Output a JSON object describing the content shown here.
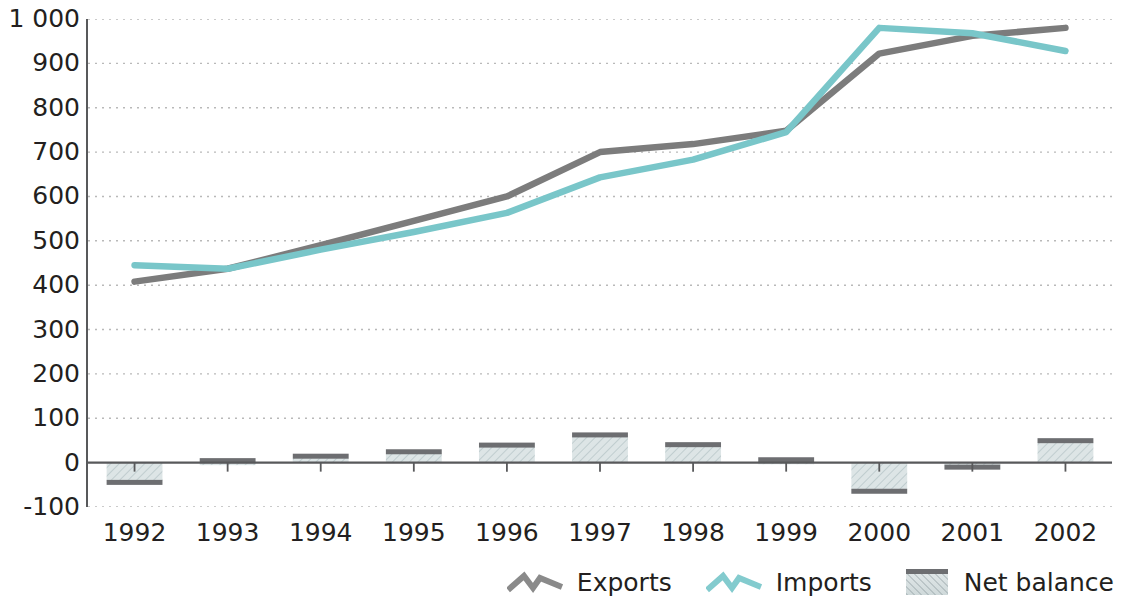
{
  "chart_data": {
    "type": "line",
    "title": "",
    "subtitle": "",
    "xlabel": "",
    "ylabel": "",
    "categories": [
      "1992",
      "1993",
      "1994",
      "1995",
      "1996",
      "1997",
      "1998",
      "1999",
      "2000",
      "2001",
      "2002"
    ],
    "x": [
      1992,
      1993,
      1994,
      1995,
      1996,
      1997,
      1998,
      1999,
      2000,
      2001,
      2002
    ],
    "ylim": [
      -100,
      1000
    ],
    "ytick_labels": [
      "1 000",
      "900",
      "800",
      "700",
      "600",
      "500",
      "400",
      "300",
      "200",
      "100",
      "0",
      "-100"
    ],
    "ytick_values": [
      1000,
      900,
      800,
      700,
      600,
      500,
      400,
      300,
      200,
      100,
      0,
      -100
    ],
    "grid": true,
    "legend_position": "bottom-right",
    "series": [
      {
        "name": "Exports",
        "type": "line",
        "color": "#7c7c7c",
        "values": [
          408,
          437,
          490,
          545,
          600,
          700,
          718,
          748,
          922,
          962,
          980
        ]
      },
      {
        "name": "Imports",
        "type": "line",
        "color": "#79c6c9",
        "values": [
          445,
          437,
          480,
          520,
          563,
          643,
          683,
          745,
          980,
          968,
          928
        ]
      },
      {
        "name": "Net balance",
        "type": "bar",
        "color": "#d8e1e2",
        "edge_color": "#6d6e71",
        "values": [
          -40,
          0,
          10,
          20,
          35,
          58,
          36,
          2,
          -60,
          -5,
          45
        ]
      }
    ]
  },
  "legend": {
    "items": [
      {
        "label": "Exports",
        "symbol": "zigzag-line",
        "color": "#7c7c7c"
      },
      {
        "label": "Imports",
        "symbol": "zigzag-line",
        "color": "#79c6c9"
      },
      {
        "label": "Net balance",
        "symbol": "filled-rect",
        "color": "#d8e1e2"
      }
    ]
  },
  "axes": {
    "y_labels": [
      "1 000",
      "900",
      "800",
      "700",
      "600",
      "500",
      "400",
      "300",
      "200",
      "100",
      "0",
      "-100"
    ],
    "x_labels": [
      "1992",
      "1993",
      "1994",
      "1995",
      "1996",
      "1997",
      "1998",
      "1999",
      "2000",
      "2001",
      "2002"
    ]
  }
}
